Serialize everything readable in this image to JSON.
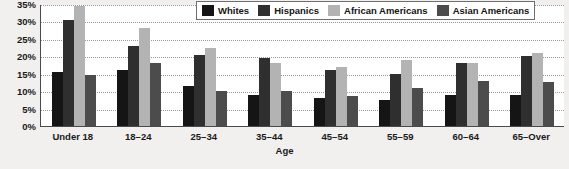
{
  "chart_data": {
    "type": "bar",
    "title": "",
    "xlabel": "Age",
    "ylabel": "",
    "ylim": [
      0,
      35
    ],
    "ytick_labels": [
      "0%",
      "5%",
      "10%",
      "15%",
      "20%",
      "25%",
      "30%",
      "35%"
    ],
    "ytick_values": [
      0,
      5,
      10,
      15,
      20,
      25,
      30,
      35
    ],
    "grid": true,
    "legend_position": "top-right",
    "categories": [
      "Under 18",
      "18–24",
      "25–34",
      "35–44",
      "45–54",
      "55–59",
      "60–64",
      "65–Over"
    ],
    "series": [
      {
        "name": "Whites",
        "color": "#151515",
        "values": [
          15.5,
          16,
          11.5,
          9,
          8,
          7.5,
          9,
          9
        ]
      },
      {
        "name": "Hispanics",
        "color": "#2f2f2f",
        "values": [
          30.5,
          23,
          20.5,
          19.5,
          16,
          15,
          18,
          20
        ]
      },
      {
        "name": "African Americans",
        "color": "#b3b3b3",
        "values": [
          34.5,
          28,
          22.5,
          18,
          17,
          19,
          18,
          21
        ]
      },
      {
        "name": "Asian Americans",
        "color": "#4c4c4c",
        "values": [
          14.5,
          18,
          10,
          10,
          8.5,
          11,
          13,
          12.5
        ]
      }
    ]
  },
  "colors": {
    "plot_background": "#ffffff",
    "figure_background": "#f1f0ee",
    "axis": "#4a4a4a",
    "gridline": "#9a9a9a",
    "text": "#1a1a1a"
  }
}
